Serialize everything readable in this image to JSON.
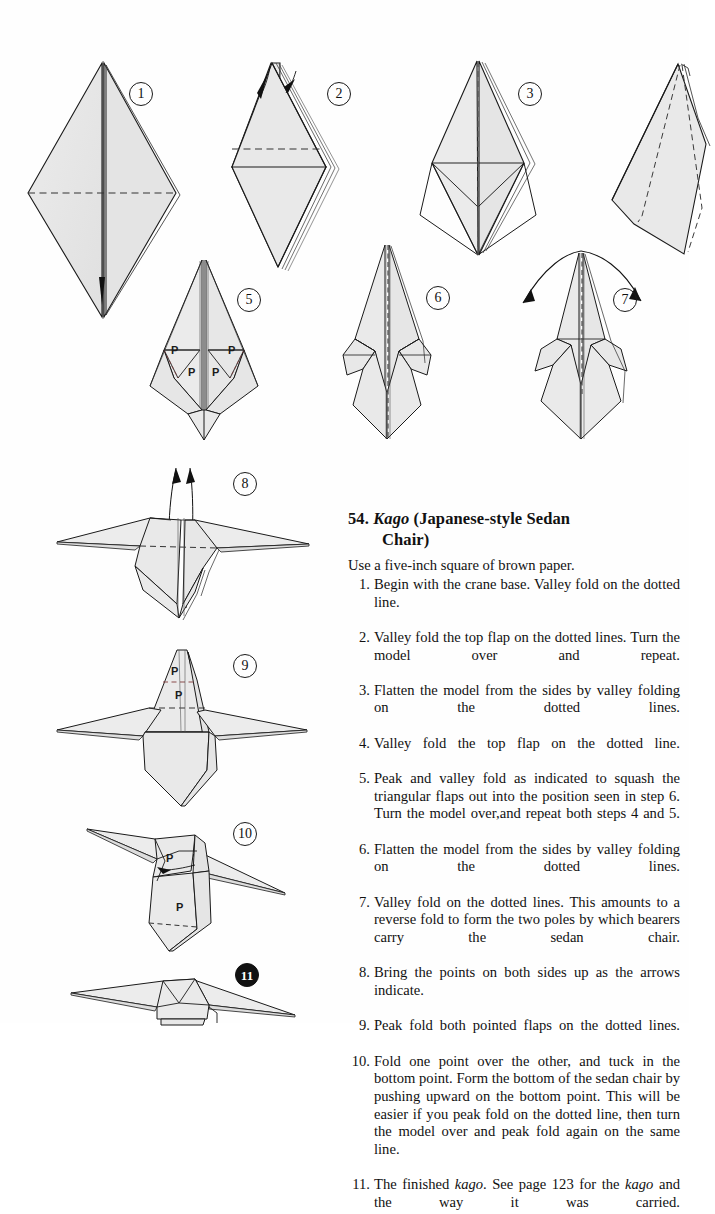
{
  "page": {
    "background_color": "#fefefe",
    "paper_fill": "#e7e7e7",
    "paper_fill_dark": "#d8d8d8",
    "line_color": "#1a1a1a",
    "fold_line_color": "#333333",
    "peak_fold_color": "#8a4a4a"
  },
  "title": {
    "number": "54.",
    "name_italic": "Kago",
    "rest_line1": "(Japanese-style  Sedan",
    "rest_line2": "Chair)"
  },
  "intro": "Use a five-inch square of brown paper.",
  "steps": [
    {
      "n": "1.",
      "text": "Begin with the crane base. Valley fold on the dotted line."
    },
    {
      "n": "2.",
      "text": "Valley fold the top flap on the dotted lines. Turn the model over and repeat."
    },
    {
      "n": "3.",
      "text": "Flatten the model from the sides by valley folding on the dotted lines."
    },
    {
      "n": "4.",
      "text": "Valley fold the top flap on the dotted line."
    },
    {
      "n": "5.",
      "text": "Peak and valley fold as indicated to squash the triangular flaps out into the position seen in step 6. Turn the model over,and repeat both steps 4 and 5."
    },
    {
      "n": "6.",
      "text": "Flatten the model from the sides by valley folding on the dotted lines."
    },
    {
      "n": "7.",
      "text": "Valley fold on the dotted lines. This amounts to a reverse fold to form the two poles by which bearers carry the sedan chair."
    },
    {
      "n": "8.",
      "text": "Bring the points on both sides up as the arrows indicate."
    },
    {
      "n": "9.",
      "text": "Peak fold both pointed flaps on the dotted lines."
    },
    {
      "n": "10.",
      "text": "Fold one point over the other, and tuck in the bottom point. Form the bottom of the sedan chair by pushing upward on the bottom point. This will be easier if you peak fold on the dotted line, then turn the model over and peak fold again on the same line."
    },
    {
      "n": "11.",
      "text_before": "The finished ",
      "italic1": "kago",
      "text_mid": ". See page 123 for the ",
      "italic2": "kago",
      "text_after": " and the way it was carried."
    }
  ],
  "figures": [
    {
      "id": 1,
      "label": "1",
      "filled": false,
      "caption": "crane base, diamond with horizontal valley fold"
    },
    {
      "id": 2,
      "label": "2",
      "filled": false,
      "caption": "kite with top flap folded, two small arrows"
    },
    {
      "id": 3,
      "label": "3",
      "filled": false,
      "caption": "kite with vertical center fold and side triangles"
    },
    {
      "id": 4,
      "label": "",
      "filled": false,
      "caption": "kite with dashed fold lines, cropped at right page edge"
    },
    {
      "id": 5,
      "label": "5",
      "filled": false,
      "caption": "squash fold markers, four P labels"
    },
    {
      "id": 6,
      "label": "6",
      "filled": false,
      "caption": "flattened model with squashed side flaps"
    },
    {
      "id": 7,
      "label": "7",
      "filled": false,
      "caption": "reverse fold with double-headed curved arrow"
    },
    {
      "id": 8,
      "label": "8",
      "filled": false,
      "caption": "model with two poles extended, two up arrows"
    },
    {
      "id": 9,
      "label": "9",
      "filled": false,
      "caption": "peak fold both pointed flaps, two P labels"
    },
    {
      "id": 10,
      "label": "10",
      "filled": false,
      "caption": "tilted model, two P labels and tuck arrow"
    },
    {
      "id": 11,
      "label": "11",
      "filled": true,
      "caption": "finished kago, cropped at bottom page edge"
    }
  ],
  "fold_markers": {
    "peak_letter": "P",
    "fig5": [
      "P",
      "P",
      "P",
      "P"
    ],
    "fig9": [
      "P",
      "P"
    ],
    "fig10": [
      "P",
      "P"
    ]
  }
}
